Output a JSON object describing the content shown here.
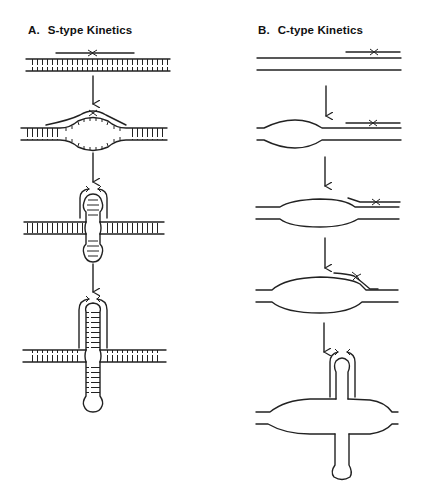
{
  "figure": {
    "panels": [
      {
        "id": "A",
        "letter": "A.",
        "title": "S-type Kinetics",
        "steps": [
          "linear duplex with annealed primer",
          "local melting bubble",
          "cruciform with short hairpin arms",
          "cruciform with extended hairpin arms"
        ]
      },
      {
        "id": "B",
        "letter": "B.",
        "title": "C-type Kinetics",
        "steps": [
          "linear duplex with primer at end",
          "small melted bubble",
          "enlarged bubble",
          "large bubble with primer sliding",
          "cruciform extruded from large bubble"
        ]
      }
    ],
    "colors": {
      "ink": "#222222",
      "background": "#ffffff"
    }
  }
}
